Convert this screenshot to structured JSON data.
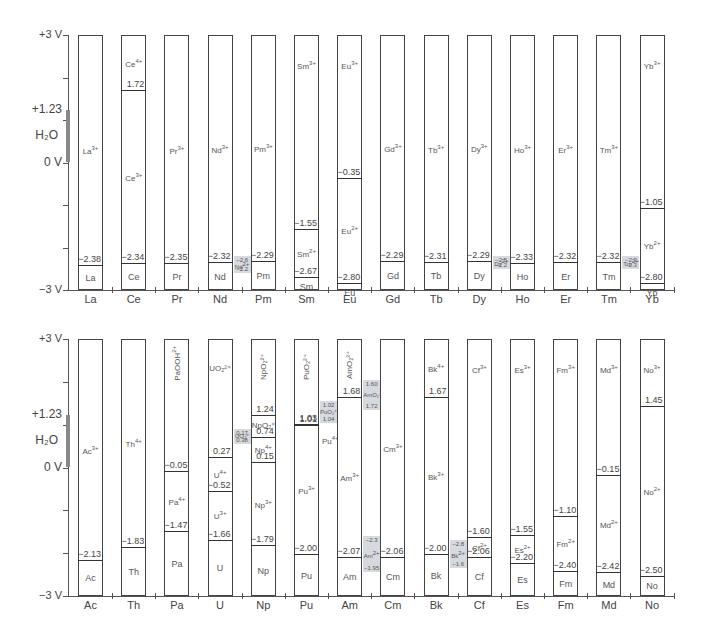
{
  "chart_data": [
    {
      "type": "table",
      "title": "Lanthanide reduction potential diagram",
      "ylabel": "Potential (V)",
      "ylim": [
        -3,
        3
      ],
      "y_ticks": [
        "+3 V",
        "+1.23",
        "0 V",
        "-3 V"
      ],
      "water_stability_window": {
        "label": "H2O",
        "from": 0,
        "to": 1.23
      },
      "categories": [
        "La",
        "Ce",
        "Pr",
        "Nd",
        "Pm",
        "Sm",
        "Eu",
        "Gd",
        "Tb",
        "Dy",
        "Ho",
        "Er",
        "Tm",
        "Yb"
      ],
      "elements": [
        {
          "el": "La",
          "ions_top_to_bottom": [
            "La3+",
            "La"
          ],
          "potentials": [
            -2.38
          ]
        },
        {
          "el": "Ce",
          "ions_top_to_bottom": [
            "Ce4+",
            "Ce3+",
            "Ce"
          ],
          "potentials": [
            1.72,
            -2.34
          ]
        },
        {
          "el": "Pr",
          "ions_top_to_bottom": [
            "Pr3+",
            "Pr"
          ],
          "potentials": [
            -2.35
          ]
        },
        {
          "el": "Nd",
          "ions_top_to_bottom": [
            "Nd3+",
            "Nd"
          ],
          "potentials": [
            -2.32
          ],
          "side": {
            "ion": "Nd2+",
            "upper": -2.6,
            "lower": -2.2
          }
        },
        {
          "el": "Pm",
          "ions_top_to_bottom": [
            "Pm3+",
            "Pm"
          ],
          "potentials": [
            -2.29
          ]
        },
        {
          "el": "Sm",
          "ions_top_to_bottom": [
            "Sm3+",
            "Sm2+",
            "Sm"
          ],
          "potentials": [
            -1.55,
            -2.67
          ]
        },
        {
          "el": "Eu",
          "ions_top_to_bottom": [
            "Eu3+",
            "Eu2+",
            "Eu"
          ],
          "potentials": [
            -0.35,
            -2.8
          ]
        },
        {
          "el": "Gd",
          "ions_top_to_bottom": [
            "Gd3+",
            "Gd"
          ],
          "potentials": [
            -2.29
          ]
        },
        {
          "el": "Tb",
          "ions_top_to_bottom": [
            "Tb3+",
            "Tb"
          ],
          "potentials": [
            -2.31
          ]
        },
        {
          "el": "Dy",
          "ions_top_to_bottom": [
            "Dy3+",
            "Dy"
          ],
          "potentials": [
            -2.29
          ],
          "side": {
            "ion": "Dy2+",
            "upper": -2.5,
            "lower": -2.2
          }
        },
        {
          "el": "Ho",
          "ions_top_to_bottom": [
            "Ho3+",
            "Ho"
          ],
          "potentials": [
            -2.33
          ]
        },
        {
          "el": "Er",
          "ions_top_to_bottom": [
            "Er3+",
            "Er"
          ],
          "potentials": [
            -2.32
          ]
        },
        {
          "el": "Tm",
          "ions_top_to_bottom": [
            "Tm3+",
            "Tm"
          ],
          "potentials": [
            -2.32
          ],
          "side": {
            "ion": "Tm2+",
            "upper": -2.3,
            "lower": -2.3
          }
        },
        {
          "el": "Yb",
          "ions_top_to_bottom": [
            "Yb3+",
            "Yb2+",
            "Yb"
          ],
          "potentials": [
            -1.05,
            -2.8
          ]
        }
      ]
    },
    {
      "type": "table",
      "title": "Actinide reduction potential diagram",
      "ylabel": "Potential (V)",
      "ylim": [
        -3,
        3
      ],
      "y_ticks": [
        "+3 V",
        "+1.23",
        "0 V",
        "-3 V"
      ],
      "water_stability_window": {
        "label": "H2O",
        "from": 0,
        "to": 1.23
      },
      "categories": [
        "Ac",
        "Th",
        "Pa",
        "U",
        "Np",
        "Pu",
        "Am",
        "Cm",
        "Bk",
        "Cf",
        "Es",
        "Fm",
        "Md",
        "No"
      ],
      "elements": [
        {
          "el": "Ac",
          "ions_top_to_bottom": [
            "Ac3+",
            "Ac"
          ],
          "potentials": [
            -2.13
          ]
        },
        {
          "el": "Th",
          "ions_top_to_bottom": [
            "Th4+",
            "Th"
          ],
          "potentials": [
            -1.83
          ]
        },
        {
          "el": "Pa",
          "ions_top_to_bottom": [
            "PaOOH2+",
            "Pa4+",
            "Pa"
          ],
          "potentials": [
            -0.05,
            -1.47
          ]
        },
        {
          "el": "U",
          "ions_top_to_bottom": [
            "UO2 2+",
            "U4+",
            "U3+",
            "U"
          ],
          "potentials": [
            0.27,
            -0.52,
            -1.66
          ],
          "side": {
            "ion": "UO2+",
            "upper": 0.17,
            "lower": 0.38
          }
        },
        {
          "el": "Np",
          "ions_top_to_bottom": [
            "NpO2 2+",
            "NpO2+",
            "Np4+",
            "Np3+",
            "Np"
          ],
          "potentials": [
            1.24,
            0.74,
            0.15,
            -1.79
          ]
        },
        {
          "el": "Pu",
          "ions_top_to_bottom": [
            "PuO2 2+",
            "Pu4+",
            "Pu3+",
            "Pu"
          ],
          "potentials": [
            1.03,
            1.01,
            -2.0
          ],
          "side": {
            "ion": "PuO2+",
            "upper": 1.02,
            "lower": 1.04
          }
        },
        {
          "el": "Am",
          "ions_top_to_bottom": [
            "AmO2 2+",
            "Am3+",
            "Am"
          ],
          "potentials": [
            1.68,
            -2.07
          ],
          "side": {
            "ion": "AmO2+",
            "upper": 1.6,
            "lower": 1.72
          },
          "side2": {
            "ion": "Am2+",
            "upper": -2.3,
            "lower": -1.95
          }
        },
        {
          "el": "Cm",
          "ions_top_to_bottom": [
            "Cm3+",
            "Cm"
          ],
          "potentials": [
            -2.06
          ]
        },
        {
          "el": "Bk",
          "ions_top_to_bottom": [
            "Bk4+",
            "Bk3+",
            "Bk"
          ],
          "potentials": [
            1.67,
            -2.0
          ],
          "side": {
            "ion": "Bk2+",
            "upper": -2.8,
            "lower": -1.6
          }
        },
        {
          "el": "Cf",
          "ions_top_to_bottom": [
            "Cf3+",
            "Cf2+",
            "Cf"
          ],
          "potentials": [
            -1.6,
            -2.06
          ]
        },
        {
          "el": "Es",
          "ions_top_to_bottom": [
            "Es3+",
            "Es2+",
            "Es"
          ],
          "potentials": [
            -1.55,
            -2.2
          ]
        },
        {
          "el": "Fm",
          "ions_top_to_bottom": [
            "Fm3+",
            "Fm2+",
            "Fm"
          ],
          "potentials": [
            -1.1,
            -2.4
          ]
        },
        {
          "el": "Md",
          "ions_top_to_bottom": [
            "Md3+",
            "Md2+",
            "Md"
          ],
          "potentials": [
            -0.15,
            -2.42
          ]
        },
        {
          "el": "No",
          "ions_top_to_bottom": [
            "No3+",
            "No2+",
            "No"
          ],
          "potentials": [
            1.45,
            -2.5
          ]
        }
      ]
    }
  ],
  "labels": {
    "top": "+3 V",
    "h2o_top": "+1.23",
    "h2o": "H₂O",
    "zero": "0 V",
    "bottom": "−3 V"
  },
  "panels": [
    {
      "id": "lanthanides",
      "columns": [
        {
          "x": "La",
          "segs": [
            {
              "ion": "La3+",
              "p": null
            },
            {
              "ion": "La",
              "p": "−2.38",
              "v": -2.38
            }
          ]
        },
        {
          "x": "Ce",
          "segs": [
            {
              "ion": "Ce4+",
              "p": null
            },
            {
              "ion": "Ce3+",
              "p": "1.72",
              "v": 1.72
            },
            {
              "ion": "Ce",
              "p": "−2.34",
              "v": -2.34
            }
          ]
        },
        {
          "x": "Pr",
          "segs": [
            {
              "ion": "Pr3+",
              "p": null
            },
            {
              "ion": "Pr",
              "p": "−2.35",
              "v": -2.35
            }
          ]
        },
        {
          "x": "Nd",
          "segs": [
            {
              "ion": "Nd3+",
              "p": null
            },
            {
              "ion": "Nd",
              "p": "−2.32",
              "v": -2.32
            }
          ],
          "side": {
            "ion": "Nd2+",
            "a": "−2.6",
            "b": "−2.2",
            "va": -2.2,
            "vb": -2.6
          }
        },
        {
          "x": "Pm",
          "segs": [
            {
              "ion": "Pm3+",
              "p": null
            },
            {
              "ion": "Pm",
              "p": "−2.29",
              "v": -2.29
            }
          ]
        },
        {
          "x": "Sm",
          "segs": [
            {
              "ion": "Sm3+",
              "p": null
            },
            {
              "ion": "Sm2+",
              "p": "−1.55",
              "v": -1.55
            },
            {
              "ion": "Sm",
              "p": "−2.67",
              "v": -2.67
            }
          ]
        },
        {
          "x": "Eu",
          "segs": [
            {
              "ion": "Eu3+",
              "p": null
            },
            {
              "ion": "Eu2+",
              "p": "−0.35",
              "v": -0.35
            },
            {
              "ion": "Eu",
              "p": "−2.80",
              "v": -2.8
            }
          ]
        },
        {
          "x": "Gd",
          "segs": [
            {
              "ion": "Gd3+",
              "p": null
            },
            {
              "ion": "Gd",
              "p": "−2.29",
              "v": -2.29
            }
          ]
        },
        {
          "x": "Tb",
          "segs": [
            {
              "ion": "Tb3+",
              "p": null
            },
            {
              "ion": "Tb",
              "p": "−2.31",
              "v": -2.31
            }
          ]
        },
        {
          "x": "Dy",
          "segs": [
            {
              "ion": "Dy3+",
              "p": null
            },
            {
              "ion": "Dy",
              "p": "−2.29",
              "v": -2.29
            }
          ],
          "side": {
            "ion": "Dy2+",
            "a": "−2.5",
            "b": "−2.2",
            "va": -2.2,
            "vb": -2.5
          }
        },
        {
          "x": "Ho",
          "segs": [
            {
              "ion": "Ho3+",
              "p": null
            },
            {
              "ion": "Ho",
              "p": "−2.33",
              "v": -2.33
            }
          ]
        },
        {
          "x": "Er",
          "segs": [
            {
              "ion": "Er3+",
              "p": null
            },
            {
              "ion": "Er",
              "p": "−2.32",
              "v": -2.32
            }
          ]
        },
        {
          "x": "Tm",
          "segs": [
            {
              "ion": "Tm3+",
              "p": null
            },
            {
              "ion": "Tm",
              "p": "−2.32",
              "v": -2.32
            }
          ],
          "side": {
            "ion": "Tm2+",
            "a": "−2.3",
            "b": "−2.3",
            "va": -2.2,
            "vb": -2.5
          }
        },
        {
          "x": "Yb",
          "segs": [
            {
              "ion": "Yb3+",
              "p": null
            },
            {
              "ion": "Yb2+",
              "p": "−1.05",
              "v": -1.05
            },
            {
              "ion": "Yb",
              "p": "−2.80",
              "v": -2.8
            }
          ]
        }
      ]
    },
    {
      "id": "actinides",
      "columns": [
        {
          "x": "Ac",
          "segs": [
            {
              "ion": "Ac3+",
              "p": null
            },
            {
              "ion": "Ac",
              "p": "−2.13",
              "v": -2.13
            }
          ]
        },
        {
          "x": "Th",
          "segs": [
            {
              "ion": "Th4+",
              "p": null
            },
            {
              "ion": "Th",
              "p": "−1.83",
              "v": -1.83
            }
          ]
        },
        {
          "x": "Pa",
          "segs": [
            {
              "ion": "PaOOH2+",
              "p": null,
              "rot": true
            },
            {
              "ion": "Pa4+",
              "p": "−0.05",
              "v": -0.05
            },
            {
              "ion": "Pa",
              "p": "−1.47",
              "v": -1.47
            }
          ]
        },
        {
          "x": "U",
          "segs": [
            {
              "ion": "UO₂²⁺",
              "p": null
            },
            {
              "ion": "U4+",
              "p": "0.27",
              "v": 0.27
            },
            {
              "ion": "U3+",
              "p": "−0.52",
              "v": -0.52
            },
            {
              "ion": "U",
              "p": "−1.66",
              "v": -1.66
            }
          ],
          "side": {
            "ion": "UO₂⁺",
            "a": "0.17",
            "b": "0.38",
            "va": 0.9,
            "vb": 0.55
          }
        },
        {
          "x": "Np",
          "segs": [
            {
              "ion": "NpO₂²⁺",
              "p": null,
              "rot": true
            },
            {
              "ion": "NpO₂⁺",
              "p": "1.24",
              "v": 1.24
            },
            {
              "ion": "Np4+",
              "p": "0.74",
              "v": 0.74
            },
            {
              "ion": "Np3+",
              "p": "0.15",
              "v": 0.15
            },
            {
              "ion": "Np",
              "p": "−1.79",
              "v": -1.79
            }
          ]
        },
        {
          "x": "Pu",
          "segs": [
            {
              "ion": "PuO₂²⁺",
              "p": null,
              "rot": true
            },
            {
              "ion": "",
              "p": "1.03",
              "v": 1.03
            },
            {
              "ion": "Pu3+",
              "p": "1.01",
              "v": 1.01
            },
            {
              "ion": "Pu",
              "p": "−2.00",
              "v": -2.0
            }
          ],
          "side": {
            "ion": "PuO₂⁺",
            "a": "1.02",
            "b": "1.04",
            "va": 1.55,
            "vb": 1.05
          },
          "note": "Pu4+"
        },
        {
          "x": "Am",
          "segs": [
            {
              "ion": "AmO₂²⁺",
              "p": null,
              "rot": true
            },
            {
              "ion": "Am3+",
              "p": "1.68",
              "v": 1.68
            },
            {
              "ion": "Am",
              "p": "−2.07",
              "v": -2.07
            }
          ],
          "side": {
            "ion": "AmO₂⁺",
            "a": "1.60",
            "b": "1.72",
            "va": 2.05,
            "vb": 1.35
          },
          "side2": {
            "ion": "Am2+",
            "a": "−2.3",
            "b": "−1.95",
            "va": -1.6,
            "vb": -2.45
          }
        },
        {
          "x": "Cm",
          "segs": [
            {
              "ion": "Cm3+",
              "p": null
            },
            {
              "ion": "Cm",
              "p": "−2.06",
              "v": -2.06
            }
          ]
        },
        {
          "x": "Bk",
          "segs": [
            {
              "ion": "Bk4+",
              "p": null
            },
            {
              "ion": "Bk3+",
              "p": "1.67",
              "v": 1.67
            },
            {
              "ion": "Bk",
              "p": "−2.00",
              "v": -2.0
            }
          ],
          "side": {
            "ion": "Bk2+",
            "a": "−2.8",
            "b": "−1.6",
            "va": -1.7,
            "vb": -2.35
          }
        },
        {
          "x": "Cf",
          "segs": [
            {
              "ion": "Cf3+",
              "p": null
            },
            {
              "ion": "Cf2+",
              "p": "−1.60",
              "v": -1.6
            },
            {
              "ion": "Cf",
              "p": "−2.06",
              "v": -2.06
            }
          ]
        },
        {
          "x": "Es",
          "segs": [
            {
              "ion": "Es3+",
              "p": null
            },
            {
              "ion": "Es2+",
              "p": "−1.55",
              "v": -1.55
            },
            {
              "ion": "Es",
              "p": "−2.20",
              "v": -2.2
            }
          ]
        },
        {
          "x": "Fm",
          "segs": [
            {
              "ion": "Fm3+",
              "p": null
            },
            {
              "ion": "Fm2+",
              "p": "−1.10",
              "v": -1.1
            },
            {
              "ion": "Fm",
              "p": "−2.40",
              "v": -2.4
            }
          ]
        },
        {
          "x": "Md",
          "segs": [
            {
              "ion": "Md3+",
              "p": null
            },
            {
              "ion": "Md2+",
              "p": "−0.15",
              "v": -0.15
            },
            {
              "ion": "Md",
              "p": "−2.42",
              "v": -2.42
            }
          ]
        },
        {
          "x": "No",
          "segs": [
            {
              "ion": "No3+",
              "p": null
            },
            {
              "ion": "No2+",
              "p": "1.45",
              "v": 1.45
            },
            {
              "ion": "No",
              "p": "−2.50",
              "v": -2.5
            }
          ]
        }
      ]
    }
  ]
}
